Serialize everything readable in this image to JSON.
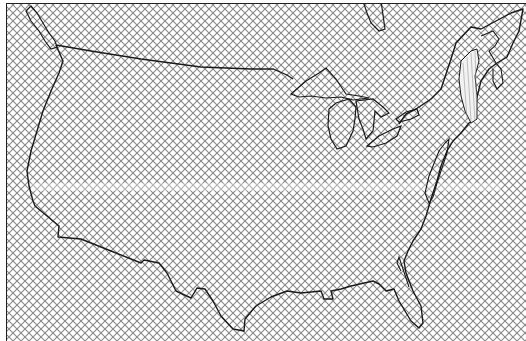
{
  "map": {
    "subject": "Contiguous United States outline",
    "fill_pattern": "diagonal-crosshatch",
    "colors": {
      "background": "#ffffff",
      "hatch": "#8a8a8a",
      "outline": "#1a1a1a",
      "frame": "#222222",
      "highlight_region": "#ffffff"
    },
    "features": [
      "us-boundary",
      "canada-border",
      "great-lakes",
      "florida-peninsula",
      "gulf-coast",
      "atlantic-coast",
      "new-england-highlighted-band",
      "chesapeake-bay",
      "puget-sound"
    ]
  }
}
